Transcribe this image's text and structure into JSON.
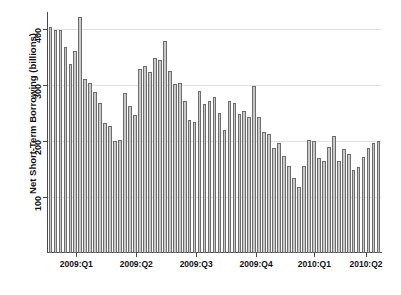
{
  "chart_data": {
    "type": "bar",
    "title": "",
    "xlabel": "",
    "ylabel": "Net Short-Term Borrowing (billions)",
    "ylim": [
      0,
      430
    ],
    "yticks": [
      100,
      200,
      300,
      400
    ],
    "ytick_labels": [
      "100",
      "200",
      "300",
      "400"
    ],
    "grid": true,
    "grid_axis": "y",
    "legend": "none",
    "bar_color": "#c9c9c9",
    "bar_edge_color": "#6d6d6d",
    "x_tick_labels": [
      "2009:Q1",
      "2009:Q2",
      "2009:Q3",
      "2009:Q4",
      "2010:Q1",
      "2010:Q2"
    ],
    "x_tick_positions_frac": [
      0.085,
      0.265,
      0.445,
      0.625,
      0.8,
      0.955
    ],
    "n_bars": 67,
    "categories": [
      "1",
      "2",
      "3",
      "4",
      "5",
      "6",
      "7",
      "8",
      "9",
      "10",
      "11",
      "12",
      "13",
      "14",
      "15",
      "16",
      "17",
      "18",
      "19",
      "20",
      "21",
      "22",
      "23",
      "24",
      "25",
      "26",
      "27",
      "28",
      "29",
      "30",
      "31",
      "32",
      "33",
      "34",
      "35",
      "36",
      "37",
      "38",
      "39",
      "40",
      "41",
      "42",
      "43",
      "44",
      "45",
      "46",
      "47",
      "48",
      "49",
      "50",
      "51",
      "52",
      "53",
      "54",
      "55",
      "56",
      "57",
      "58",
      "59",
      "60",
      "61",
      "62",
      "63",
      "64",
      "65",
      "66",
      "67"
    ],
    "values": [
      403,
      398,
      398,
      368,
      338,
      360,
      421,
      310,
      303,
      288,
      268,
      232,
      227,
      200,
      201,
      285,
      263,
      247,
      328,
      333,
      323,
      348,
      345,
      378,
      325,
      302,
      303,
      272,
      238,
      233,
      289,
      266,
      272,
      278,
      250,
      219,
      272,
      268,
      248,
      253,
      242,
      298,
      242,
      216,
      213,
      187,
      196,
      173,
      155,
      133,
      118,
      156,
      201,
      199,
      170,
      165,
      190,
      208,
      165,
      185,
      176,
      148,
      153,
      172,
      188,
      197,
      200
    ]
  }
}
